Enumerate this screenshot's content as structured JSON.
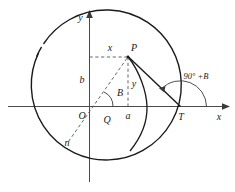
{
  "figure": {
    "type": "geometry-diagram",
    "axes": {
      "x_label": "x",
      "y_label": "y",
      "origin_label": "O"
    },
    "points": [
      {
        "id": "O",
        "label": "O",
        "role": "origin"
      },
      {
        "id": "P",
        "label": "P",
        "role": "point-on-circle"
      },
      {
        "id": "Q",
        "label": "Q",
        "role": "intersection-point"
      },
      {
        "id": "T",
        "label": "T",
        "role": "tangent-intersection-x-axis"
      },
      {
        "id": "n",
        "label": "n",
        "role": "lower-left-endpoint"
      }
    ],
    "segment_labels": {
      "horizontal_from_yaxis_to_P": "x",
      "vertical_from_origin_up": "b",
      "vertical_from_P_to_xaxis": "y",
      "foot_of_perpendicular_on_xaxis": "a"
    },
    "angles": [
      {
        "id": "angle-B",
        "label": "B",
        "at": "Q",
        "description": "angle between x-axis direction and line Q-P"
      },
      {
        "id": "angle-90-plus-B",
        "label": "90° +B",
        "at": "T",
        "description": "exterior angle at T between tangent line and positive x-axis"
      }
    ],
    "colors": {
      "stroke_primary": "#1a1a1a",
      "stroke_axis": "#4a4a4a",
      "stroke_dashed": "#555555",
      "background": "#ffffff"
    }
  }
}
